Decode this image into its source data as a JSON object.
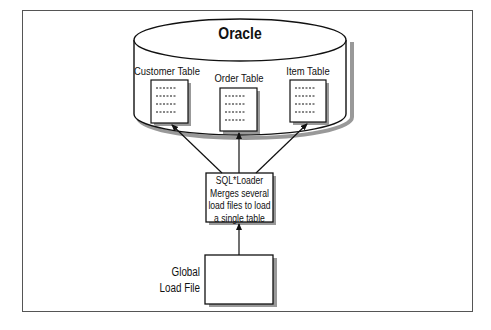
{
  "diagram": {
    "database": {
      "label": "Oracle"
    },
    "tables": [
      {
        "label": "Customer Table"
      },
      {
        "label": "Order Table"
      },
      {
        "label": "Item Table"
      }
    ],
    "loader": {
      "lines": [
        "SQL*Loader",
        "Merges several",
        "load files to load",
        "a single table"
      ]
    },
    "source": {
      "lines": [
        "Global",
        "Load File"
      ]
    },
    "colors": {
      "stroke": "#111111",
      "shadow": "#888888",
      "frame": "#555555",
      "background": "#ffffff"
    }
  }
}
